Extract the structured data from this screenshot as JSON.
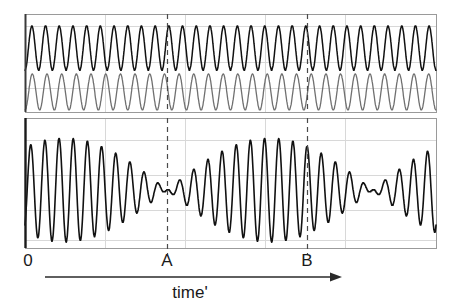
{
  "figure": {
    "type": "wave-interference-beats",
    "background_color": "#ffffff",
    "width": 453,
    "height": 303
  },
  "axis": {
    "origin_label": "0",
    "time_axis_label": "time'",
    "arrow_icon_name": "right-arrow-icon"
  },
  "markers": [
    {
      "label": "A",
      "x_px": 167,
      "kind": "beat-node-dashed-line"
    },
    {
      "label": "B",
      "x_px": 307,
      "kind": "beat-antinode-dashed-line"
    }
  ],
  "panels": {
    "top": {
      "name": "component-waves-panel",
      "frame": {
        "x": 25,
        "y": 14,
        "width": 411,
        "height": 98
      },
      "border_color": "#9a9a9a",
      "gridline_color": "#d8d8d8",
      "vertical_gridlines_px": [
        105,
        185,
        265,
        345
      ],
      "horizontal_gridlines_px": [
        26,
        62,
        88
      ]
    },
    "bottom": {
      "name": "superposition-panel",
      "frame": {
        "x": 25,
        "y": 118,
        "width": 411,
        "height": 130
      },
      "border_color": "#9a9a9a",
      "gridline_color": "#d8d8d8",
      "vertical_gridlines_px": [
        105,
        185,
        265,
        345
      ],
      "horizontal_gridlines_px": [
        140,
        175,
        210,
        240
      ]
    }
  },
  "chart_data": {
    "type": "line",
    "title": "",
    "xlabel": "time'",
    "ylabel": "",
    "grid": true,
    "legend": false,
    "xlim": [
      0,
      411
    ],
    "annotations": [
      {
        "text": "0",
        "x": 0,
        "note": "time origin at left axis"
      },
      {
        "text": "A",
        "x": 142,
        "note": "destructive interference / beat minimum"
      },
      {
        "text": "B",
        "x": 282,
        "note": "constructive interference / beat maximum"
      }
    ],
    "series": [
      {
        "name": "wave-1",
        "panel": "top",
        "color": "#111111",
        "line_width": 1.5,
        "waveform": "sine",
        "cycles_across_panel": 30.0,
        "amplitude": 0.82,
        "baseline_y_px": 48,
        "amplitude_px": 22,
        "phase_deg": 270
      },
      {
        "name": "wave-2",
        "panel": "top",
        "color": "#707070",
        "line_width": 1.3,
        "waveform": "sine",
        "cycles_across_panel": 28.0,
        "amplitude": 0.82,
        "baseline_y_px": 92,
        "amplitude_px": 18,
        "phase_deg": 270
      },
      {
        "name": "superposition",
        "panel": "bottom",
        "color": "#111111",
        "line_width": 1.6,
        "waveform": "sum-of-wave-1-and-wave-2",
        "carrier_cycles_across_panel": 29.0,
        "beat_cycles_across_panel": 2.0,
        "beat_node_x_px": 142,
        "beat_antinode_x_px": 282,
        "baseline_y_px": 190,
        "amplitude_px": 52
      }
    ]
  }
}
